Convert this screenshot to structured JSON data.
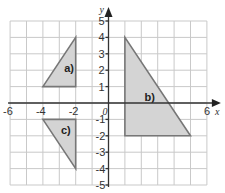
{
  "diagram": {
    "type": "coordinate-grid",
    "x_range": [
      -6,
      6
    ],
    "y_range": [
      -5,
      5
    ],
    "x_axis_label": "x",
    "y_axis_label": "y",
    "x_tick_labels": [
      "-6",
      "-4",
      "-2",
      "0",
      "6"
    ],
    "x_ticks_values": [
      -6,
      -4,
      -2,
      0,
      6
    ],
    "y_tick_labels": [
      "5",
      "4",
      "3",
      "2",
      "1",
      "-1",
      "-2",
      "-3",
      "-4",
      "-5"
    ],
    "y_ticks_values": [
      5,
      4,
      3,
      2,
      1,
      -1,
      -2,
      -3,
      -4,
      -5
    ],
    "shapes": [
      {
        "label": "a)",
        "vertices": [
          [
            -4,
            1
          ],
          [
            -2,
            1
          ],
          [
            -2,
            4
          ]
        ],
        "label_pos": [
          -2.7,
          1.9
        ]
      },
      {
        "label": "b)",
        "vertices": [
          [
            1,
            4
          ],
          [
            1,
            -2
          ],
          [
            5,
            -2
          ]
        ],
        "label_pos": [
          2.2,
          0.1
        ]
      },
      {
        "label": "c)",
        "vertices": [
          [
            -4,
            -1
          ],
          [
            -2,
            -1
          ],
          [
            -2,
            -4
          ]
        ],
        "label_pos": [
          -2.9,
          -1.9
        ]
      }
    ],
    "colors": {
      "fill": "#d4d4d4",
      "stroke": "#777777",
      "grid": "#c9c9c9",
      "axis": "#333333"
    }
  }
}
